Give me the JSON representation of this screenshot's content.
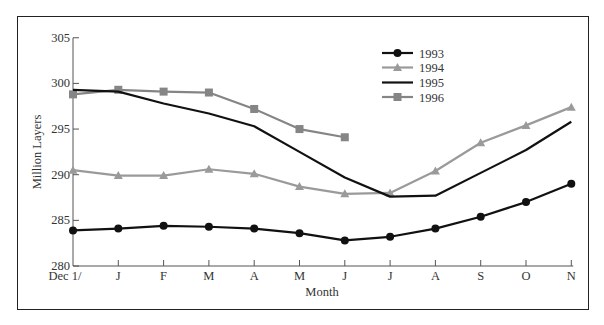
{
  "chart_data": {
    "type": "line",
    "title": "",
    "xlabel": "Month",
    "ylabel": "Million Layers",
    "ylim": [
      280,
      305
    ],
    "yticks": [
      280,
      285,
      290,
      295,
      300,
      305
    ],
    "categories": [
      "Dec 1/",
      "J",
      "F",
      "M",
      "A",
      "M",
      "J",
      "J",
      "A",
      "S",
      "O",
      "N"
    ],
    "grid": false,
    "legend_position": "upper right (inside plot)",
    "series": [
      {
        "name": "1993",
        "color": "#111111",
        "marker": "circle",
        "values": [
          283.9,
          284.1,
          284.4,
          284.3,
          284.1,
          283.6,
          282.8,
          283.2,
          284.1,
          285.4,
          287.0,
          289.0
        ]
      },
      {
        "name": "1994",
        "color": "#9a9a9a",
        "marker": "triangle",
        "values": [
          290.5,
          289.9,
          289.9,
          290.6,
          290.1,
          288.7,
          287.9,
          288.0,
          290.4,
          293.5,
          295.4,
          297.4
        ]
      },
      {
        "name": "1995",
        "color": "#111111",
        "marker": "none",
        "values": [
          299.3,
          299.1,
          297.8,
          296.7,
          295.3,
          292.5,
          289.7,
          287.6,
          287.7,
          290.2,
          292.7,
          295.8
        ]
      },
      {
        "name": "1996",
        "color": "#858585",
        "marker": "square",
        "values": [
          298.8,
          299.3,
          299.1,
          299.0,
          297.2,
          295.0,
          294.1,
          null,
          null,
          null,
          null,
          null
        ]
      }
    ]
  }
}
